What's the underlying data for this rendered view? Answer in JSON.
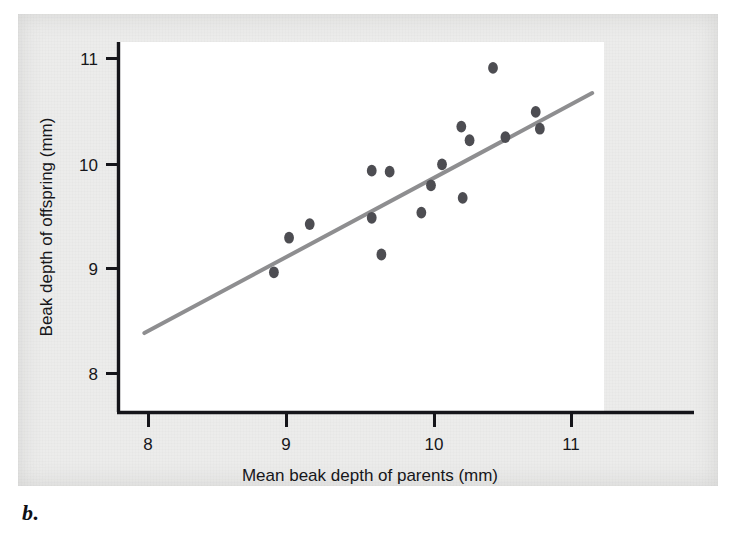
{
  "figure": {
    "caption_label": "b.",
    "background_color": "#ececeb",
    "plot_background_color": "#ffffff"
  },
  "chart_data": {
    "type": "scatter",
    "title": "",
    "xlabel": "Mean beak depth of parents (mm)",
    "ylabel": "Beak depth of offspring (mm)",
    "xlim": [
      7.79,
      11.21
    ],
    "ylim": [
      7.62,
      11.15
    ],
    "xticks": [
      8,
      9,
      10,
      11
    ],
    "yticks": [
      8,
      9,
      10,
      11
    ],
    "xtick_labels": [
      "8",
      "9",
      "10",
      "11"
    ],
    "ytick_labels": [
      "8",
      "9",
      "10",
      "11"
    ],
    "grid": false,
    "legend": false,
    "marker_color": "#4d4d52",
    "marker_size": 11,
    "points": [
      {
        "x": 8.91,
        "y": 8.96
      },
      {
        "x": 9.02,
        "y": 9.29
      },
      {
        "x": 9.17,
        "y": 9.42
      },
      {
        "x": 9.62,
        "y": 9.93
      },
      {
        "x": 9.62,
        "y": 9.48
      },
      {
        "x": 9.69,
        "y": 9.13
      },
      {
        "x": 9.75,
        "y": 9.92
      },
      {
        "x": 9.98,
        "y": 9.53
      },
      {
        "x": 10.05,
        "y": 9.79
      },
      {
        "x": 10.13,
        "y": 9.99
      },
      {
        "x": 10.27,
        "y": 10.35
      },
      {
        "x": 10.28,
        "y": 9.67
      },
      {
        "x": 10.33,
        "y": 10.22
      },
      {
        "x": 10.5,
        "y": 10.91
      },
      {
        "x": 10.59,
        "y": 10.25
      },
      {
        "x": 10.81,
        "y": 10.49
      },
      {
        "x": 10.84,
        "y": 10.33
      }
    ],
    "trendline": {
      "type": "linear-fit",
      "color": "#8e8e90",
      "width": 4,
      "x_start": 7.97,
      "y_start": 8.38,
      "x_end": 11.22,
      "y_end": 10.67
    }
  },
  "axis": {
    "x_tick_0": "8",
    "x_tick_1": "9",
    "x_tick_2": "10",
    "x_tick_3": "11",
    "y_tick_0": "8",
    "y_tick_1": "9",
    "y_tick_2": "10",
    "y_tick_3": "11",
    "x_title": "Mean beak depth of parents (mm)",
    "y_title": "Beak depth of offspring (mm)"
  }
}
